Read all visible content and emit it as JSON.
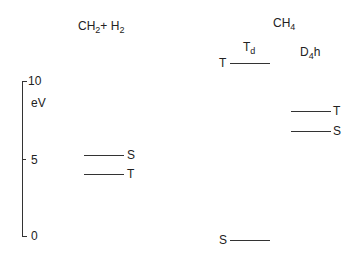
{
  "diagram": {
    "type": "energy-level-diagram",
    "axis": {
      "unit": "eV",
      "ticks": [
        {
          "value": "10",
          "y": 81
        },
        {
          "value": "5",
          "y": 159
        },
        {
          "value": "0",
          "y": 236
        }
      ]
    },
    "columns": [
      {
        "name": "CH2+H2",
        "base": "CH",
        "sub1": "2",
        "mid": "+ H",
        "sub2": "2"
      },
      {
        "name": "CH4",
        "base": "CH",
        "sub1": "4"
      },
      {
        "name": "Td",
        "base": "T",
        "sub1": "d"
      },
      {
        "name": "D4h",
        "base": "D",
        "sub1": "4",
        "tail": "h"
      }
    ],
    "levels": {
      "ch2_h2": [
        {
          "state": "S",
          "energy_ev": 5.2
        },
        {
          "state": "T",
          "energy_ev": 4.0
        }
      ],
      "td": [
        {
          "state": "T",
          "energy_ev": 11.2
        },
        {
          "state": "S",
          "energy_ev": -0.2
        }
      ],
      "d4h": [
        {
          "state": "T",
          "energy_ev": 8.0
        },
        {
          "state": "S",
          "energy_ev": 6.8
        }
      ]
    }
  }
}
